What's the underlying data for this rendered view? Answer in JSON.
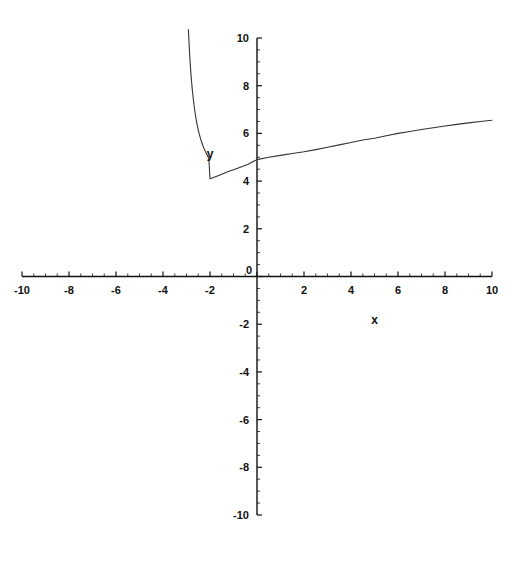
{
  "chart_data": {
    "type": "line",
    "title": "",
    "subtitle": "",
    "xlabel": "x",
    "ylabel": "y",
    "xlim": [
      -10,
      10
    ],
    "ylim": [
      -10,
      10
    ],
    "grid": false,
    "legend": null,
    "axis_style": "cartesian-cross",
    "x_ticks_major": [
      -10,
      -8,
      -6,
      -4,
      -2,
      0,
      2,
      4,
      6,
      8,
      10
    ],
    "x_tick_labels": [
      "-10",
      "-8",
      "-6",
      "-4",
      "-2",
      "0",
      "2",
      "4",
      "6",
      "8",
      "10"
    ],
    "y_ticks_major": [
      -10,
      -8,
      -6,
      -4,
      -2,
      0,
      2,
      4,
      6,
      8,
      10
    ],
    "y_tick_labels": [
      "-10",
      "-8",
      "-6",
      "-4",
      "-2",
      "0",
      "2",
      "4",
      "6",
      "8",
      "10"
    ],
    "minor_tick_interval": 0.5,
    "curve_color": "#333333",
    "axis_color": "#111111",
    "series": [
      {
        "name": "curve",
        "minimum_point": [
          -2,
          4
        ],
        "points": [
          [
            -2.92,
            10.35
          ],
          [
            -2.9,
            9.95
          ],
          [
            -2.85,
            9.05
          ],
          [
            -2.8,
            8.35
          ],
          [
            -2.75,
            7.8
          ],
          [
            -2.7,
            7.35
          ],
          [
            -2.65,
            6.97
          ],
          [
            -2.6,
            6.65
          ],
          [
            -2.55,
            6.38
          ],
          [
            -2.5,
            6.15
          ],
          [
            -2.45,
            5.95
          ],
          [
            -2.4,
            5.77
          ],
          [
            -2.35,
            5.62
          ],
          [
            -2.3,
            5.48
          ],
          [
            -2.25,
            5.36
          ],
          [
            -2.2,
            5.25
          ],
          [
            -2.15,
            5.15
          ],
          [
            -2.1,
            5.05
          ],
          [
            -2.05,
            4.95
          ],
          [
            -2.0,
            4.1
          ],
          [
            -1.9,
            4.13
          ],
          [
            -1.8,
            4.17
          ],
          [
            -1.6,
            4.25
          ],
          [
            -1.4,
            4.33
          ],
          [
            -1.2,
            4.41
          ],
          [
            -1.0,
            4.48
          ],
          [
            -0.8,
            4.55
          ],
          [
            -0.6,
            4.62
          ],
          [
            -0.4,
            4.7
          ],
          [
            -0.2,
            4.8
          ],
          [
            0.0,
            4.9
          ],
          [
            0.5,
            5.0
          ],
          [
            1.0,
            5.08
          ],
          [
            1.5,
            5.16
          ],
          [
            2.0,
            5.23
          ],
          [
            2.5,
            5.32
          ],
          [
            3.0,
            5.42
          ],
          [
            3.5,
            5.52
          ],
          [
            4.0,
            5.62
          ],
          [
            4.5,
            5.72
          ],
          [
            5.0,
            5.8
          ],
          [
            5.5,
            5.9
          ],
          [
            6.0,
            6.0
          ],
          [
            6.5,
            6.08
          ],
          [
            7.0,
            6.16
          ],
          [
            7.5,
            6.24
          ],
          [
            8.0,
            6.31
          ],
          [
            8.5,
            6.38
          ],
          [
            9.0,
            6.44
          ],
          [
            9.5,
            6.5
          ],
          [
            10.0,
            6.55
          ]
        ]
      }
    ]
  },
  "labels": {
    "x_axis_name": "x",
    "y_axis_name": "y"
  }
}
